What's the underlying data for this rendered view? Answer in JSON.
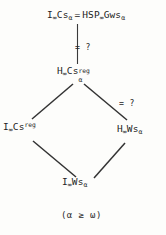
{
  "diagram": {
    "type": "hasse-lattice",
    "caption": "(α ≥ ω)",
    "nodes": [
      {
        "id": "top",
        "left_base": "I",
        "left_sub": "∞",
        "left_base2": "Cs",
        "left_sub2": "α",
        "relation": "=",
        "right_base": "HSP",
        "right_sub": "∞",
        "right_base2": "Gws",
        "right_sub2": "α",
        "text": "I∞Csα = HSP∞Gwsα"
      },
      {
        "id": "hcsreg",
        "base": "H",
        "sub": "∞",
        "base2": "Cs",
        "sup": "reg",
        "sub2": "α",
        "text": "H∞Cs^reg_α"
      },
      {
        "id": "icsreg",
        "base": "I",
        "sub": "∞",
        "base2": "Cs",
        "sup": "reg",
        "text": "I∞Cs^reg"
      },
      {
        "id": "hws",
        "base": "H",
        "sub": "∞",
        "base2": "Ws",
        "sub2": "α",
        "text": "H∞Wsα"
      },
      {
        "id": "iws",
        "base": "I",
        "sub": "∞",
        "base2": "Ws",
        "sub2": "α",
        "text": "I∞Wsα"
      }
    ],
    "edge_labels": [
      {
        "id": "top-edge-label",
        "text": "= ?"
      },
      {
        "id": "right-edge-label",
        "text": "= ?"
      }
    ],
    "edges": [
      {
        "from": "top",
        "to": "hcsreg",
        "kind": "vertical",
        "label": "= ?"
      },
      {
        "from": "hcsreg",
        "to": "icsreg",
        "kind": "diagonal-left",
        "label": ""
      },
      {
        "from": "hcsreg",
        "to": "hws",
        "kind": "diagonal-right",
        "label": "= ?"
      },
      {
        "from": "icsreg",
        "to": "iws",
        "kind": "diagonal-right-down",
        "label": ""
      },
      {
        "from": "hws",
        "to": "iws",
        "kind": "diagonal-left-down",
        "label": ""
      }
    ],
    "colors": {
      "ink": "#232323",
      "background": "#fdfdfb",
      "edge": "#333333"
    }
  }
}
